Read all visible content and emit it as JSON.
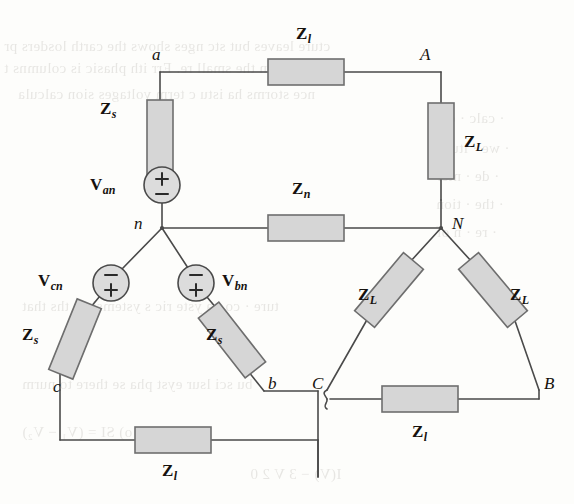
{
  "figure": {
    "kind": "circuit-schematic",
    "canvas": {
      "width": 574,
      "height": 504
    },
    "colors": {
      "background": "#fdfdfb",
      "wire": "#4a4a4a",
      "component_fill": "#d6d6d6",
      "component_stroke": "#6e6e6e",
      "text": "#16120e",
      "ghost_text": "#5a5248"
    }
  },
  "nodes": [
    {
      "id": "node-a",
      "label": "a",
      "x": 152,
      "y": 56
    },
    {
      "id": "node-A",
      "label": "A",
      "x": 420,
      "y": 56
    },
    {
      "id": "node-n",
      "label": "n",
      "x": 134,
      "y": 222
    },
    {
      "id": "node-N",
      "label": "N",
      "x": 452,
      "y": 222
    },
    {
      "id": "node-b",
      "label": "b",
      "x": 268,
      "y": 388
    },
    {
      "id": "node-B",
      "label": "B",
      "x": 544,
      "y": 388
    },
    {
      "id": "node-c",
      "label": "c",
      "x": 53,
      "y": 388
    },
    {
      "id": "node-C",
      "label": "C",
      "x": 312,
      "y": 388
    }
  ],
  "components": [
    {
      "id": "z-l-top",
      "label": "Z",
      "sub": "l",
      "label_x": 296,
      "label_y": 33,
      "kind": "line-impedance",
      "orientation": "horizontal"
    },
    {
      "id": "z-s-left",
      "label": "Z",
      "sub": "s",
      "label_x": 108,
      "label_y": 108,
      "kind": "source-impedance",
      "orientation": "vertical"
    },
    {
      "id": "z-L-right",
      "label": "Z",
      "sub": "L",
      "label_x": 452,
      "label_y": 140,
      "kind": "load-impedance",
      "orientation": "vertical"
    },
    {
      "id": "z-n-middle",
      "label": "Z",
      "sub": "n",
      "label_x": 292,
      "label_y": 183,
      "kind": "neutral-impedance",
      "orientation": "horizontal"
    },
    {
      "id": "z-L-lower-left",
      "label": "Z",
      "sub": "L",
      "label_x": 362,
      "label_y": 290,
      "kind": "load-impedance",
      "orientation": "diagonal"
    },
    {
      "id": "z-L-lower-right",
      "label": "Z",
      "sub": "L",
      "label_x": 497,
      "label_y": 290,
      "kind": "load-impedance",
      "orientation": "diagonal"
    },
    {
      "id": "z-s-lower-left",
      "label": "Z",
      "sub": "s",
      "label_x": 32,
      "label_y": 332,
      "kind": "source-impedance",
      "orientation": "diagonal"
    },
    {
      "id": "z-s-lower-right",
      "label": "Z",
      "sub": "s",
      "label_x": 200,
      "label_y": 332,
      "kind": "source-impedance",
      "orientation": "diagonal"
    },
    {
      "id": "z-l-bottom-left",
      "label": "Z",
      "sub": "l",
      "label_x": 152,
      "label_y": 466,
      "kind": "line-impedance",
      "orientation": "horizontal"
    },
    {
      "id": "z-l-bottom-right",
      "label": "Z",
      "sub": "l",
      "label_x": 406,
      "label_y": 427,
      "kind": "line-impedance",
      "orientation": "horizontal"
    }
  ],
  "sources": [
    {
      "id": "v-an",
      "label": "V",
      "sub": "an",
      "label_x": 69,
      "label_y": 178,
      "cx": 162,
      "cy": 185,
      "r": 18,
      "top_sign": "+",
      "bottom_sign": "−"
    },
    {
      "id": "v-cn",
      "label": "V",
      "sub": "cn",
      "label_x": 31,
      "label_y": 272,
      "cx": 111,
      "cy": 283,
      "r": 18,
      "top_sign": "−",
      "bottom_sign": "+"
    },
    {
      "id": "v-bn",
      "label": "V",
      "sub": "bn",
      "label_x": 218,
      "label_y": 272,
      "cx": 196,
      "cy": 283,
      "r": 18,
      "top_sign": "−",
      "bottom_sign": "+"
    }
  ],
  "ghost_text": [
    {
      "text": "cture leaves but stc     nges shows the carth losders pr",
      "x": 4,
      "y": 38
    },
    {
      "text": "n in the small re. Err  ith phasic is columns t",
      "x": 4,
      "y": 60
    },
    {
      "text": "nce storms  ha  istu c  term  voltages  sion calcula",
      "x": 18,
      "y": 86
    },
    {
      "text": "· calc  · det",
      "x": 436,
      "y": 110
    },
    {
      "text": "· we   · itude",
      "x": 436,
      "y": 140
    },
    {
      "text": "· de    · nter",
      "x": 436,
      "y": 168
    },
    {
      "text": "· the   · tion",
      "x": 436,
      "y": 196
    },
    {
      "text": "· re    · n  of",
      "x": 436,
      "y": 224
    },
    {
      "text": "ture  · co na yste ric  s ystemsicat ths  that",
      "x": 22,
      "y": 298
    },
    {
      "text": "bu  sci   lsur  eyst   pha   se  there to nurm",
      "x": 22,
      "y": 376
    },
    {
      "text": "w     ll( Vy  · o)  SI =  (V₁ − V₂)",
      "x": 22,
      "y": 424
    },
    {
      "text": "I(V)   − 3 V    2 0",
      "x": 250,
      "y": 466
    }
  ]
}
